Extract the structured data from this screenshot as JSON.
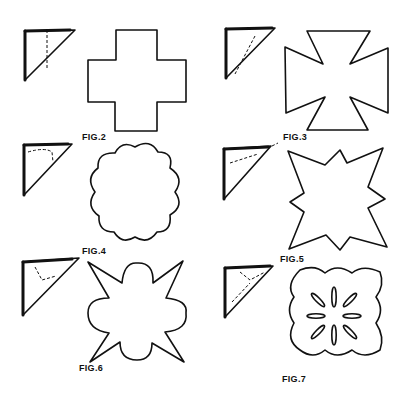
{
  "page": {
    "background": "#ffffff",
    "ink": "#111111"
  },
  "figures": [
    {
      "id": "fig2",
      "label": "FIG.2",
      "shape": "cross"
    },
    {
      "id": "fig3",
      "label": "FIG.3",
      "shape": "maltese-cross"
    },
    {
      "id": "fig4",
      "label": "FIG.4",
      "shape": "scalloped-flower"
    },
    {
      "id": "fig5",
      "label": "FIG.5",
      "shape": "spiked-star"
    },
    {
      "id": "fig6",
      "label": "FIG.6",
      "shape": "scalloped-star"
    },
    {
      "id": "fig7",
      "label": "FIG.7",
      "shape": "quatrefoil-with-slits"
    }
  ]
}
